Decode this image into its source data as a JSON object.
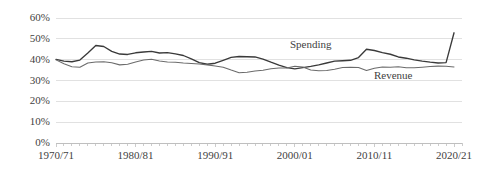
{
  "chart_data": {
    "type": "line",
    "title": "",
    "subtitle": "",
    "xlabel": "",
    "ylabel": "",
    "grid": true,
    "legend_position": "inline-annotations",
    "ylim": [
      0,
      60
    ],
    "ytick_labels": [
      "60%",
      "50%",
      "40%",
      "30%",
      "20%",
      "10%",
      "0%"
    ],
    "ytick_values": [
      60,
      50,
      40,
      30,
      20,
      10,
      0
    ],
    "xtick_labels": [
      "1970/71",
      "1980/81",
      "1990/91",
      "2000/01",
      "2010/11",
      "2020/21"
    ],
    "xtick_values": [
      1970,
      1980,
      1990,
      2000,
      2010,
      2020
    ],
    "xlim": [
      1970,
      2021
    ],
    "x": [
      1970,
      1971,
      1972,
      1973,
      1974,
      1975,
      1976,
      1977,
      1978,
      1979,
      1980,
      1981,
      1982,
      1983,
      1984,
      1985,
      1986,
      1987,
      1988,
      1989,
      1990,
      1991,
      1992,
      1993,
      1994,
      1995,
      1996,
      1997,
      1998,
      1999,
      2000,
      2001,
      2002,
      2003,
      2004,
      2005,
      2006,
      2007,
      2008,
      2009,
      2010,
      2011,
      2012,
      2013,
      2014,
      2015,
      2016,
      2017,
      2018,
      2019,
      2020
    ],
    "series": [
      {
        "name": "Spending",
        "color": "#3a3a3a",
        "values": [
          40.1,
          39.3,
          39.0,
          39.8,
          43.2,
          46.8,
          46.3,
          44.0,
          42.7,
          42.5,
          43.3,
          43.7,
          44.0,
          43.2,
          43.4,
          42.8,
          42.0,
          40.4,
          38.6,
          37.8,
          38.3,
          39.7,
          41.1,
          41.5,
          41.4,
          41.3,
          40.3,
          38.8,
          37.4,
          36.2,
          35.6,
          36.2,
          36.8,
          37.5,
          38.4,
          39.3,
          39.5,
          39.7,
          41.0,
          45.0,
          44.4,
          43.4,
          42.6,
          41.3,
          40.7,
          39.9,
          39.3,
          38.8,
          38.4,
          38.6,
          52.9
        ]
      },
      {
        "name": "Revenue",
        "color": "#6b6b6b",
        "values": [
          39.9,
          38.0,
          36.6,
          36.4,
          38.4,
          38.9,
          39.0,
          38.5,
          37.5,
          37.8,
          38.9,
          39.8,
          40.2,
          39.4,
          38.9,
          38.8,
          38.4,
          38.2,
          37.9,
          37.5,
          37.0,
          36.4,
          35.0,
          33.7,
          34.0,
          34.6,
          34.9,
          35.6,
          36.0,
          36.0,
          36.8,
          36.5,
          35.0,
          34.7,
          34.8,
          35.4,
          36.2,
          36.3,
          36.2,
          34.8,
          35.9,
          36.5,
          36.4,
          36.6,
          36.1,
          36.1,
          36.4,
          36.7,
          36.9,
          36.8,
          36.5
        ]
      }
    ],
    "annotations": [
      {
        "text": "Spending",
        "x_px": 290,
        "y_px": 39
      },
      {
        "text": "Revenue",
        "x_px": 374,
        "y_px": 70
      }
    ],
    "axis_colors": {
      "gridline": "#d9d9d9",
      "axis_line": "#bfbfbf",
      "tick": "#bfbfbf",
      "text": "#3f3f3f"
    }
  }
}
